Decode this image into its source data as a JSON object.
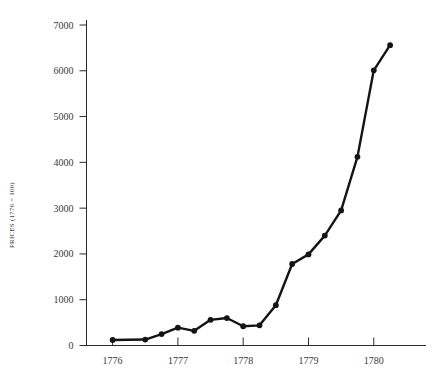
{
  "chart_data": {
    "type": "line",
    "title": "",
    "xlabel": "",
    "ylabel": "PRICES (1776 = 100)",
    "xlim": [
      1775.6,
      1780.8
    ],
    "ylim": [
      0,
      7000
    ],
    "grid": false,
    "legend": "none",
    "x_ticks": [
      1776,
      1777,
      1778,
      1779,
      1780
    ],
    "x_tick_labels": [
      "1776",
      "1777",
      "1778",
      "1779",
      "1780"
    ],
    "y_ticks": [
      0,
      1000,
      2000,
      3000,
      4000,
      5000,
      6000,
      7000
    ],
    "y_tick_labels": [
      "0",
      "1000",
      "2000",
      "3000",
      "4000",
      "5000",
      "6000",
      "7000"
    ],
    "series": [
      {
        "name": "Prices index",
        "color": "#141414",
        "marker": "circle",
        "x": [
          1776.0,
          1776.5,
          1776.75,
          1777.0,
          1777.25,
          1777.5,
          1777.75,
          1778.0,
          1778.25,
          1778.5,
          1778.75,
          1779.0,
          1779.25,
          1779.5,
          1779.75,
          1780.0,
          1780.25
        ],
        "y": [
          120,
          130,
          250,
          390,
          320,
          560,
          600,
          420,
          440,
          880,
          1780,
          1990,
          2400,
          2950,
          4120,
          6010,
          6560
        ]
      }
    ],
    "annotations": []
  },
  "axis_title_text": "PRICES (1776 = 100)"
}
